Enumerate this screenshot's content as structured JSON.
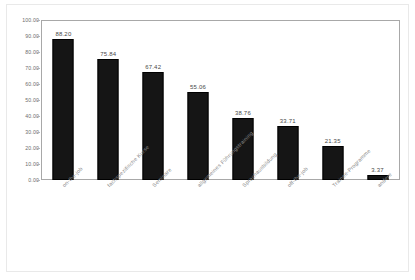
{
  "chart_data": {
    "type": "bar",
    "title": "",
    "subtitle": "",
    "xlabel": "",
    "ylabel": "",
    "ylim": [
      0,
      100
    ],
    "ytick_labels": [
      "100.00",
      "90.00",
      "80.00",
      "70.00",
      "60.00",
      "50.00",
      "40.00",
      "30.00",
      "20.00",
      "10.00",
      "0.00"
    ],
    "ytick_values": [
      100,
      90,
      80,
      70,
      60,
      50,
      40,
      30,
      20,
      10,
      0
    ],
    "grid": false,
    "legend": false,
    "categories": [
      "on-the-job",
      "fachspezifische Kurse",
      "Seminare",
      "allgemeines Führungstraining",
      "Sprachausbildung",
      "off-the-job",
      "Trainee-Programme",
      "andere"
    ],
    "values": [
      88.2,
      75.84,
      67.42,
      55.06,
      38.76,
      33.71,
      21.35,
      3.37
    ],
    "value_labels": [
      "88.20",
      "75.84",
      "67.42",
      "55.06",
      "38.76",
      "33.71",
      "21.35",
      "3.37"
    ],
    "bar_color": "#151515",
    "frame_color": "#a8a8a8",
    "tick_text_color": "#6d6d6d",
    "category_text_color": "#8a8a8a",
    "value_text_color": "#4a4a4a"
  }
}
